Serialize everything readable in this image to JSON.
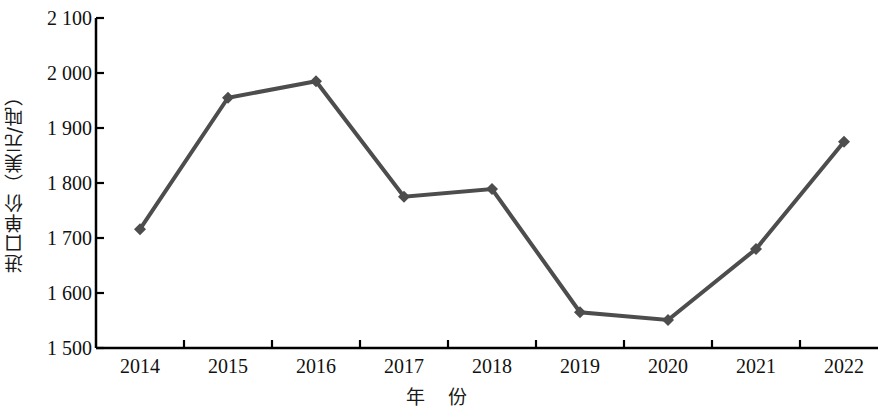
{
  "chart_data": {
    "type": "line",
    "title": "",
    "xlabel": "年 份",
    "ylabel": "进口单价（美元/吨）",
    "categories": [
      "2014",
      "2015",
      "2016",
      "2017",
      "2018",
      "2019",
      "2020",
      "2021",
      "2022"
    ],
    "values": [
      1716,
      1955,
      1985,
      1775,
      1789,
      1565,
      1551,
      1680,
      1875
    ],
    "series": [
      {
        "name": "进口单价",
        "values": [
          1716,
          1955,
          1985,
          1775,
          1789,
          1565,
          1551,
          1680,
          1875
        ]
      }
    ],
    "ylim": [
      1500,
      2100
    ],
    "ytick_labels": [
      "2 100",
      "2 000",
      "1 900",
      "1 800",
      "1 700",
      "1 600",
      "1 500"
    ],
    "ytick_values": [
      2100,
      2000,
      1900,
      1800,
      1700,
      1600,
      1500
    ],
    "grid": false,
    "legend": "none",
    "line_color": "#4d4d4d",
    "marker_color": "#4d4d4d",
    "marker_shape": "diamond",
    "axis_color": "#000000"
  }
}
